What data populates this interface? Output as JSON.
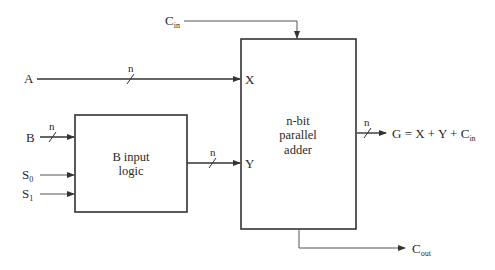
{
  "diagram": {
    "type": "block-diagram",
    "colors": {
      "line": "#333333",
      "background": "#ffffff",
      "text": "#2a2a2a"
    },
    "blocks": [
      {
        "id": "b_input_logic",
        "line1": "B input",
        "line2": "logic"
      },
      {
        "id": "adder",
        "line1": "n-bit",
        "line2": "parallel",
        "line3": "adder"
      }
    ],
    "inputs": {
      "A": "A",
      "B": "B",
      "S0": {
        "base": "S",
        "sub": "0"
      },
      "S1": {
        "base": "S",
        "sub": "1"
      },
      "Cin": {
        "base": "C",
        "sub": "in"
      }
    },
    "ports": {
      "X": "X",
      "Y": "Y"
    },
    "outputs": {
      "G": {
        "text": "G = X + Y + C",
        "sub": "in"
      },
      "Cout": {
        "base": "C",
        "sub": "out"
      }
    },
    "bus_width_label": "n",
    "edges": [
      {
        "from": "A",
        "to": "adder.X",
        "bus": "n"
      },
      {
        "from": "B",
        "to": "b_input_logic",
        "bus": "n"
      },
      {
        "from": "S0",
        "to": "b_input_logic"
      },
      {
        "from": "S1",
        "to": "b_input_logic"
      },
      {
        "from": "b_input_logic",
        "to": "adder.Y",
        "bus": "n"
      },
      {
        "from": "Cin",
        "to": "adder"
      },
      {
        "from": "adder",
        "to": "G",
        "bus": "n"
      },
      {
        "from": "adder",
        "to": "Cout"
      }
    ]
  }
}
